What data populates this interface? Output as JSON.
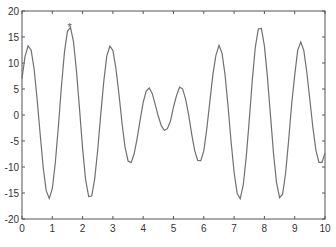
{
  "chart_data": {
    "type": "line",
    "title": "",
    "xlabel": "",
    "ylabel": "",
    "xlim": [
      0,
      10
    ],
    "ylim": [
      -20,
      20
    ],
    "grid": false,
    "legend": null,
    "xticks": [
      0,
      1,
      2,
      3,
      4,
      5,
      6,
      7,
      8,
      9,
      10
    ],
    "yticks": [
      -20,
      -15,
      -10,
      -5,
      0,
      5,
      10,
      15,
      20
    ],
    "line_color": "#707070",
    "axis_color": "#555555",
    "marker": {
      "x": 1.57,
      "y": 17.0,
      "symbol": "*",
      "label": "max"
    },
    "series": [
      {
        "name": "f(x)",
        "x": [
          0,
          0.1,
          0.2,
          0.3,
          0.4,
          0.5,
          0.6,
          0.7,
          0.8,
          0.9,
          1,
          1.1,
          1.2,
          1.3,
          1.4,
          1.5,
          1.6,
          1.7,
          1.8,
          1.9,
          2,
          2.1,
          2.2,
          2.3,
          2.4,
          2.5,
          2.6,
          2.7,
          2.8,
          2.9,
          3,
          3.1,
          3.2,
          3.3,
          3.4,
          3.5,
          3.6,
          3.7,
          3.8,
          3.9,
          4,
          4.1,
          4.2,
          4.3,
          4.4,
          4.5,
          4.6,
          4.7,
          4.8,
          4.9,
          5,
          5.1,
          5.2,
          5.3,
          5.4,
          5.5,
          5.6,
          5.7,
          5.8,
          5.9,
          6,
          6.1,
          6.2,
          6.3,
          6.4,
          6.5,
          6.6,
          6.7,
          6.8,
          6.9,
          7,
          7.1,
          7.2,
          7.3,
          7.4,
          7.5,
          7.6,
          7.7,
          7.8,
          7.9,
          8,
          8.1,
          8.2,
          8.3,
          8.4,
          8.5,
          8.6,
          8.7,
          8.8,
          8.9,
          9,
          9.1,
          9.2,
          9.3,
          9.4,
          9.5,
          9.6,
          9.7,
          9.8,
          9.9,
          10
        ],
        "values": [
          7.0,
          11.24,
          13.29,
          12.51,
          8.89,
          3.07,
          -3.75,
          -10.1,
          -14.56,
          -16.06,
          -14.17,
          -9.21,
          -2.18,
          5.43,
          12.0,
          16.1,
          16.84,
          14.07,
          8.38,
          0.98,
          -6.46,
          -12.43,
          -15.68,
          -15.58,
          -12.27,
          -6.53,
          0.22,
          6.49,
          11.36,
          13.23,
          12.41,
          8.98,
          3.94,
          -1.54,
          -6.18,
          -8.85,
          -9.16,
          -7.5,
          -4.54,
          -0.91,
          2.42,
          4.6,
          5.2,
          4.12,
          1.95,
          -0.25,
          -2.1,
          -2.98,
          -2.63,
          -1.17,
          1.54,
          3.74,
          5.34,
          5.03,
          3.05,
          -0.02,
          -3.67,
          -6.84,
          -8.75,
          -8.78,
          -6.91,
          -2.66,
          2.67,
          7.8,
          11.48,
          13.38,
          11.9,
          7.81,
          1.76,
          -5.14,
          -11.01,
          -15.03,
          -16.09,
          -13.56,
          -8.15,
          -0.89,
          6.71,
          13.02,
          16.54,
          16.63,
          13.29,
          7.32,
          -0.11,
          -7.38,
          -12.99,
          -15.9,
          -15.24,
          -11.22,
          -4.96,
          2.15,
          7.61,
          12.49,
          14.04,
          12.44,
          8.23,
          3.01,
          -2.42,
          -6.76,
          -9.11,
          -9.11,
          -7.29
        ]
      }
    ]
  }
}
